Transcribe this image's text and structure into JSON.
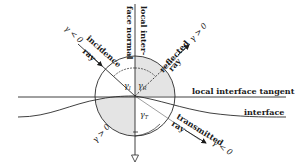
{
  "diagram": {
    "labels": {
      "normal_line1": "local inter-",
      "normal_line2": "face normal",
      "incidence": "incidence",
      "incidence_ray": "ray",
      "incidence_sign": "γ < 0",
      "reflected": "reflected",
      "reflected_ray": "ray",
      "reflected_sign": "γ > 0",
      "tangent": "local interface tangent",
      "interface": "interface",
      "transmitted": "transmitted",
      "transmitted_ray": "ray",
      "transmitted_sign": "γ < 0",
      "lower_left_sign": "γ > 0",
      "angle_incidence": "γ",
      "angle_incidence_sub": "I",
      "angle_reflected": "γ",
      "angle_reflected_sub": "R",
      "angle_transmitted": "γ",
      "angle_transmitted_sub": "T"
    },
    "colors": {
      "line": "#2a2a2a",
      "shade": "#e4e4e4",
      "background": "#ffffff"
    }
  }
}
